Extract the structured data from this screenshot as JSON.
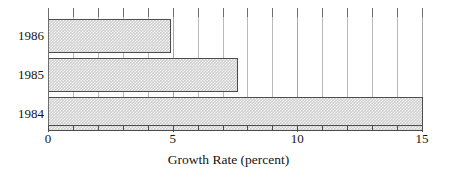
{
  "chart_data": {
    "type": "bar",
    "orientation": "horizontal",
    "title": "",
    "subtitle": "",
    "xlabel": "Growth Rate (percent)",
    "ylabel": "",
    "categories": [
      "1986",
      "1985",
      "1984"
    ],
    "values": [
      4.9,
      7.6,
      15.0
    ],
    "series": [
      {
        "name": "Growth Rate",
        "values": [
          4.9,
          7.6,
          15.0
        ]
      }
    ],
    "xlim": [
      0,
      15
    ],
    "ylim": [
      0,
      3
    ],
    "x_tick_labels": [
      "0",
      "5",
      "10",
      "15"
    ],
    "x_tick_values": [
      0,
      5,
      10,
      15
    ],
    "x_minor_tick_values": [
      1,
      2,
      3,
      4,
      6,
      7,
      8,
      9,
      11,
      12,
      13,
      14
    ],
    "gridlines": "vertical",
    "legend": "none",
    "bar_fill_color": "#cfcfcf",
    "bar_border_color": "#4d4d4d",
    "grid_color": "#b9b9b9",
    "axis_color": "#4d4d4d",
    "background_color": "#ffffff"
  }
}
